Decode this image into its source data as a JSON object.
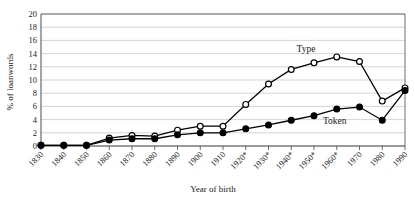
{
  "chart_data": {
    "type": "line",
    "title": "",
    "xlabel": "Year of birth",
    "ylabel": "% of loanwords",
    "ylim": [
      0,
      20
    ],
    "ytick_step": 2,
    "yticks": [
      0,
      2,
      4,
      6,
      8,
      10,
      12,
      14,
      16,
      18,
      20
    ],
    "grid": true,
    "grid_axis": "y",
    "legend_position": "inline-annotation",
    "categories": [
      "1830",
      "1840",
      "1850",
      "1860",
      "1870",
      "1880",
      "1890",
      "1900",
      "1910",
      "1920*",
      "1930*",
      "1940*",
      "1950*",
      "1960*",
      "1970",
      "1980",
      "1990"
    ],
    "series": [
      {
        "name": "Type",
        "marker": "open-circle",
        "values": [
          0.1,
          0.1,
          0.1,
          1.2,
          1.6,
          1.5,
          2.4,
          3.0,
          3.0,
          6.3,
          9.4,
          11.6,
          12.6,
          13.5,
          12.8,
          6.8,
          8.8
        ]
      },
      {
        "name": "Token",
        "marker": "filled-circle",
        "values": [
          0.1,
          0.1,
          0.1,
          0.9,
          1.1,
          1.1,
          1.7,
          2.0,
          2.0,
          2.6,
          3.2,
          3.9,
          4.6,
          5.6,
          5.9,
          3.9,
          8.4
        ]
      }
    ],
    "annotations": [
      {
        "text": "Type",
        "series": "Type"
      },
      {
        "text": "Token",
        "series": "Token"
      }
    ]
  },
  "colors": {
    "line": "#000000",
    "marker_open_fill": "#ffffff",
    "marker_filled_fill": "#000000",
    "grid": "#c9c9c9",
    "axis": "#4a4a4a",
    "text": "#1a1a1a",
    "background": "#ffffff"
  }
}
